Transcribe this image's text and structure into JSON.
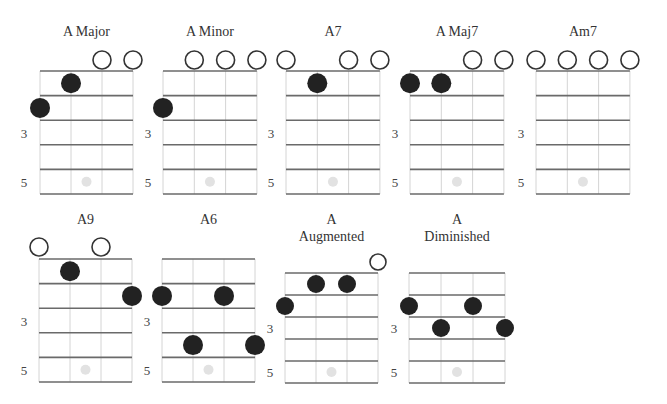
{
  "colors": {
    "fret_line": "#6a6a6a",
    "string_line": "#d4d4d4",
    "finger_dot": "#222222",
    "open_circle": "#333333",
    "marker_dot": "#e2e2e2",
    "text": "#333333"
  },
  "fret_labels": [
    "3",
    "5"
  ],
  "chords": [
    {
      "id": "a-major",
      "title_lines": [
        "A Major"
      ],
      "frets": [
        2,
        1,
        0,
        0
      ],
      "layout": {
        "x0": 40,
        "top": 71,
        "string_gap": 31,
        "fret_gap": 24.6,
        "title_y": 36,
        "open_y": 60,
        "open_r": 9,
        "dot_r": 10,
        "label_x": 24
      }
    },
    {
      "id": "a-minor",
      "title_lines": [
        "A Minor"
      ],
      "frets": [
        2,
        0,
        0,
        0
      ],
      "layout": {
        "x0": 163,
        "top": 71,
        "string_gap": 31.3,
        "fret_gap": 24.6,
        "title_y": 36,
        "open_y": 60,
        "open_r": 9,
        "dot_r": 10,
        "label_x": 148
      }
    },
    {
      "id": "a7",
      "title_lines": [
        "A7"
      ],
      "frets": [
        0,
        1,
        0,
        0
      ],
      "layout": {
        "x0": 286,
        "top": 71,
        "string_gap": 31.3,
        "fret_gap": 24.6,
        "title_y": 36,
        "open_y": 60,
        "open_r": 9,
        "dot_r": 10,
        "label_x": 271
      }
    },
    {
      "id": "a-maj7",
      "title_lines": [
        "A Maj7"
      ],
      "frets": [
        1,
        1,
        0,
        0
      ],
      "layout": {
        "x0": 410,
        "top": 71,
        "string_gap": 31.3,
        "fret_gap": 24.6,
        "title_y": 36,
        "open_y": 60,
        "open_r": 9,
        "dot_r": 10,
        "label_x": 395
      }
    },
    {
      "id": "am7",
      "title_lines": [
        "Am7"
      ],
      "frets": [
        0,
        0,
        0,
        0
      ],
      "layout": {
        "x0": 536,
        "top": 71,
        "string_gap": 31.3,
        "fret_gap": 24.6,
        "title_y": 36,
        "open_y": 60,
        "open_r": 9,
        "dot_r": 10,
        "label_x": 521
      }
    },
    {
      "id": "a9",
      "title_lines": [
        "A9"
      ],
      "frets": [
        0,
        1,
        0,
        2
      ],
      "layout": {
        "x0": 39,
        "top": 259,
        "string_gap": 31,
        "fret_gap": 24.6,
        "title_y": 224,
        "open_y": 247,
        "open_r": 9,
        "dot_r": 10,
        "label_x": 24
      }
    },
    {
      "id": "a6",
      "title_lines": [
        "A6"
      ],
      "frets": [
        2,
        4,
        2,
        4
      ],
      "layout": {
        "x0": 162,
        "top": 259,
        "string_gap": 31,
        "fret_gap": 24.6,
        "title_y": 224,
        "open_y": 247,
        "open_r": 9,
        "dot_r": 10,
        "label_x": 147
      }
    },
    {
      "id": "a-augmented",
      "title_lines": [
        "A",
        "Augmented"
      ],
      "frets": [
        2,
        1,
        1,
        0
      ],
      "layout": {
        "x0": 285,
        "top": 273,
        "string_gap": 31,
        "fret_gap": 22,
        "title_y": 224,
        "open_y": 262,
        "open_r": 8,
        "dot_r": 9,
        "label_x": 270
      }
    },
    {
      "id": "a-diminished",
      "title_lines": [
        "A",
        "Diminished"
      ],
      "frets": [
        2,
        3,
        2,
        3
      ],
      "layout": {
        "x0": 409,
        "top": 273,
        "string_gap": 32,
        "fret_gap": 22,
        "title_y": 224,
        "open_y": 262,
        "open_r": 8,
        "dot_r": 9,
        "label_x": 394
      }
    }
  ]
}
